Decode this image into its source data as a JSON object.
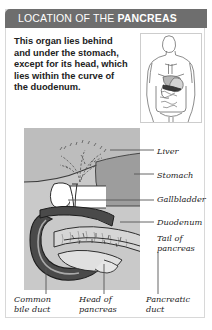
{
  "header": {
    "title_normal": "LOCATION OF THE ",
    "title_bold": "PANCREAS",
    "bg_color": "#6e6e6e",
    "text_color": "#ffffff"
  },
  "intro": {
    "text": "This organ lies behind and under the stomach, except for its head, which lies within the curve of the duodenum."
  },
  "body_figure": {
    "name": "human-torso-digestive-system",
    "description": "Outline of human torso showing liver, stomach, intestines with pancreas highlighted"
  },
  "illustration": {
    "panel_color": "#c9c9c9",
    "liver_color": "#bdbdbd",
    "stomach_color": "#9d9d9d",
    "duodenum_color": "#4a4a4a",
    "pancreas_color": "#d6d6d6",
    "gallbladder_color": "#ffffff"
  },
  "side_labels": [
    {
      "id": "liver",
      "text": "Liver",
      "top": 147,
      "left": 157
    },
    {
      "id": "stomach",
      "text": "Stomach",
      "top": 171,
      "left": 157
    },
    {
      "id": "gallbladder",
      "text": "Gallbladder",
      "top": 195,
      "left": 157
    },
    {
      "id": "duodenum",
      "text": "Duodenum",
      "top": 218,
      "left": 157
    },
    {
      "id": "tail-of-pancreas",
      "text": "Tail of\npancreas",
      "top": 234,
      "left": 157
    }
  ],
  "bottom_labels": [
    {
      "id": "common-bile-duct",
      "text": "Common\nbile duct",
      "left": 14,
      "top": 295
    },
    {
      "id": "head-of-pancreas",
      "text": "Head of\npancreas",
      "left": 79,
      "top": 295
    },
    {
      "id": "pancreatic-duct",
      "text": "Pancreatic\nduct",
      "left": 146,
      "top": 295
    }
  ]
}
